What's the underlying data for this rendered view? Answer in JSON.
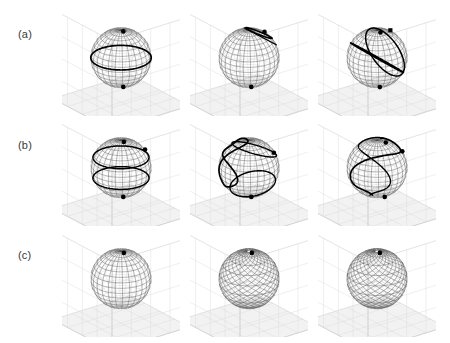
{
  "figure": {
    "type": "multi-panel-3d-sphere-plot",
    "background_color": "#ffffff",
    "grid": {
      "rows": 3,
      "cols": 3
    },
    "row_labels": [
      {
        "id": "a",
        "text": "(a)",
        "x": 18,
        "y": 28
      },
      {
        "id": "b",
        "text": "(b)",
        "x": 18,
        "y": 139
      },
      {
        "id": "c",
        "text": "(c)",
        "x": 18,
        "y": 249
      }
    ],
    "corner_artifact": "",
    "colors": {
      "mesh": "#4a4a4a",
      "mesh_light": "#8a8a8a",
      "trajectory": "#000000",
      "marker": "#000000",
      "axis_box": "#c9c9c9",
      "axis_grid": "#dcdcdc",
      "floor": "#f2f2f2",
      "label": "#3a3a3a"
    },
    "panel_layout": {
      "width": 118,
      "height": 108,
      "col_x": [
        62,
        190,
        318
      ],
      "row_y": [
        8,
        118,
        229
      ]
    }
  },
  "chart_data": {
    "type": "scatter",
    "title": "",
    "xlabel": "",
    "ylabel": "",
    "panels": [
      {
        "id": "a1",
        "row": "a",
        "col": 1,
        "sphere_radius": 1.0,
        "mesh_style": "dense-lat-lon",
        "trajectory": {
          "name": "equatorial-ring",
          "description": "Thick closed circle at the equator plus heavy polar caps",
          "kind": "latitude-circle",
          "latitude_deg": 0,
          "closed": true
        },
        "markers": [
          {
            "name": "north-pole-marker",
            "theta_deg": 8,
            "phi_deg": 95,
            "shape": "dot"
          },
          {
            "name": "south-pole-marker",
            "theta_deg": 172,
            "phi_deg": 95,
            "shape": "dot"
          }
        ]
      },
      {
        "id": "a2",
        "row": "a",
        "col": 2,
        "sphere_radius": 1.0,
        "mesh_style": "dense-lat-lon",
        "trajectory": {
          "name": "tilted-small-loop",
          "description": "Tight tilted loop near the north pole ending at a marker on the right",
          "kind": "tilted-loop",
          "tilt_deg": 28,
          "latitude_deg": 62,
          "closed": false
        },
        "markers": [
          {
            "name": "endpoint-marker",
            "theta_deg": 32,
            "phi_deg": 20,
            "shape": "dot"
          },
          {
            "name": "south-pole-marker",
            "theta_deg": 172,
            "phi_deg": 95,
            "shape": "dot"
          }
        ]
      },
      {
        "id": "a3",
        "row": "a",
        "col": 3,
        "sphere_radius": 1.0,
        "mesh_style": "dense-lat-lon",
        "trajectory": {
          "name": "tilted-great-circle-with-loop",
          "description": "Large tilted ellipse crossing the sphere with a small loop on the lower right",
          "kind": "tilted-great-circle",
          "tilt_deg": 38,
          "latitude_deg": 0,
          "closed": false
        },
        "markers": [
          {
            "name": "endpoint-marker",
            "theta_deg": 30,
            "phi_deg": 8,
            "shape": "square"
          },
          {
            "name": "north-pole-marker",
            "theta_deg": 12,
            "phi_deg": 95,
            "shape": "dot"
          },
          {
            "name": "south-pole-marker",
            "theta_deg": 170,
            "phi_deg": 95,
            "shape": "dot"
          }
        ]
      },
      {
        "id": "b1",
        "row": "b",
        "col": 1,
        "sphere_radius": 1.0,
        "mesh_style": "dense-lat-lon",
        "trajectory": {
          "name": "two-latitude-rings",
          "description": "Two heavy latitude circles, one above and one below the equator",
          "kind": "latitude-circle-pair",
          "latitude_deg": 22,
          "closed": true
        },
        "markers": [
          {
            "name": "endpoint-marker",
            "theta_deg": 62,
            "phi_deg": 10,
            "shape": "dot"
          },
          {
            "name": "north-pole-marker",
            "theta_deg": 10,
            "phi_deg": 95,
            "shape": "dot"
          },
          {
            "name": "south-pole-marker",
            "theta_deg": 172,
            "phi_deg": 95,
            "shape": "dot"
          }
        ]
      },
      {
        "id": "b2",
        "row": "b",
        "col": 2,
        "sphere_radius": 1.0,
        "mesh_style": "dense-lat-lon",
        "trajectory": {
          "name": "figure-eight",
          "description": "S-shaped figure-eight sweeping from the upper left lobe to the lower right lobe",
          "kind": "figure-eight",
          "tilt_deg": 18,
          "closed": false
        },
        "markers": [
          {
            "name": "endpoint-marker",
            "theta_deg": 72,
            "phi_deg": 6,
            "shape": "dot"
          },
          {
            "name": "south-pole-marker",
            "theta_deg": 172,
            "phi_deg": 95,
            "shape": "dot"
          }
        ]
      },
      {
        "id": "b3",
        "row": "b",
        "col": 3,
        "sphere_radius": 1.0,
        "mesh_style": "dense-lat-lon",
        "trajectory": {
          "name": "meridional-s-curve",
          "description": "Vertical S-shaped meridional path running from the north pole to the south pole",
          "kind": "meridian-spiral",
          "tilt_deg": 10,
          "closed": false
        },
        "markers": [
          {
            "name": "top-marker",
            "theta_deg": 18,
            "phi_deg": 60,
            "shape": "dot"
          },
          {
            "name": "mid-marker",
            "theta_deg": 66,
            "phi_deg": 12,
            "shape": "dot"
          },
          {
            "name": "bottom-marker",
            "theta_deg": 160,
            "phi_deg": 80,
            "shape": "dot"
          }
        ]
      },
      {
        "id": "c1",
        "row": "c",
        "col": 1,
        "sphere_radius": 1.0,
        "mesh_style": "dense-lat-lon",
        "trajectory": null,
        "markers": [
          {
            "name": "north-pole-marker",
            "theta_deg": 10,
            "phi_deg": 95,
            "shape": "dot"
          }
        ]
      },
      {
        "id": "c2",
        "row": "c",
        "col": 2,
        "sphere_radius": 1.0,
        "mesh_style": "dense-diagonal-weave",
        "trajectory": null,
        "markers": [
          {
            "name": "north-pole-marker",
            "theta_deg": 10,
            "phi_deg": 95,
            "shape": "dot"
          }
        ]
      },
      {
        "id": "c3",
        "row": "c",
        "col": 3,
        "sphere_radius": 1.0,
        "mesh_style": "dense-diagonal-weave",
        "trajectory": null,
        "markers": [
          {
            "name": "north-pole-marker",
            "theta_deg": 10,
            "phi_deg": 95,
            "shape": "dot"
          }
        ]
      }
    ]
  }
}
